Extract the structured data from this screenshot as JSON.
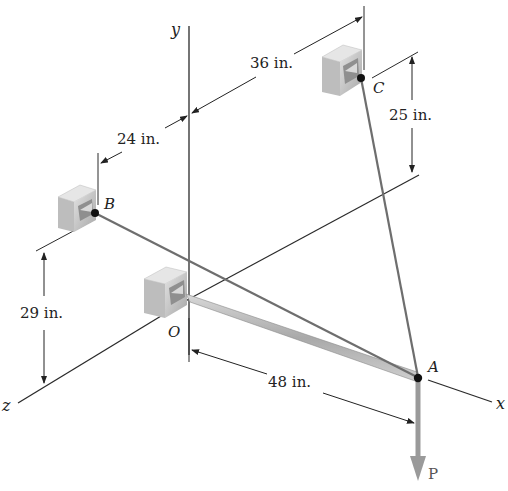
{
  "figure": {
    "type": "statics 3D force diagram",
    "axes": {
      "x": "x",
      "y": "y",
      "z": "z"
    },
    "points": {
      "O": "O",
      "A": "A",
      "B": "B",
      "C": "C"
    },
    "force": {
      "label": "P",
      "direction": "down"
    },
    "dimensions": {
      "d_24": "24 in.",
      "d_36": "36 in.",
      "d_25": "25 in.",
      "d_29": "29 in.",
      "d_48": "48 in."
    },
    "colors": {
      "line": "#2a2a2a",
      "cable": "#7a7a7a",
      "boom": "#b5b5b5",
      "force_arrow": "#9a9a9a",
      "bracket_face": "#d6d6d6",
      "bracket_side": "#a8a8a8"
    }
  }
}
